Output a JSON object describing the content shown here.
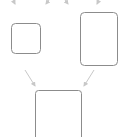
{
  "diagram": {
    "colors": {
      "box_stroke": "#8c8c8c",
      "arrow": "#c8c8c8",
      "background": "#ffffff"
    },
    "nodes": [
      {
        "id": "box-small-left",
        "x": 11.5,
        "y": 23.5,
        "w": 29,
        "h": 30,
        "r": 4
      },
      {
        "id": "box-tall-right",
        "x": 80.5,
        "y": 12.5,
        "w": 37,
        "h": 53,
        "r": 4
      },
      {
        "id": "box-bottom-center",
        "x": 35.5,
        "y": 90.5,
        "w": 46,
        "h": 60,
        "r": 3
      }
    ],
    "edges": [
      {
        "id": "arrow-top-1",
        "x1": 11,
        "y1": -4,
        "x2": 15,
        "y2": 4
      },
      {
        "id": "arrow-top-2",
        "x1": 52,
        "y1": -4,
        "x2": 46,
        "y2": 4
      },
      {
        "id": "arrow-top-3",
        "x1": 62,
        "y1": -4,
        "x2": 68,
        "y2": 4
      },
      {
        "id": "arrow-top-4",
        "x1": 101,
        "y1": -4,
        "x2": 97,
        "y2": 4
      },
      {
        "id": "arrow-left-to-bottom",
        "x1": 25,
        "y1": 70,
        "x2": 35,
        "y2": 86
      },
      {
        "id": "arrow-right-to-bottom",
        "x1": 94,
        "y1": 70,
        "x2": 84,
        "y2": 86
      }
    ]
  }
}
